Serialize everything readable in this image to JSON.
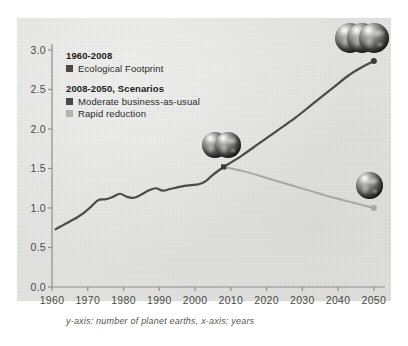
{
  "caption": "y-axis: number of planet earths, x-axis: years",
  "legend": {
    "historical_header": "1960-2008",
    "historical_label": "Ecological Footprint",
    "scenarios_header": "2008-2050, Scenarios",
    "bau_label": "Moderate business-as-usual",
    "rapid_label": "Rapid reduction",
    "dark_color": "#4a4a46",
    "light_color": "#b4b4b0"
  },
  "chart_data": {
    "type": "line",
    "title": "",
    "xlabel": "years",
    "ylabel": "number of planet earths",
    "xlim": [
      1960,
      2052
    ],
    "ylim": [
      0.0,
      3.05
    ],
    "grid": false,
    "legend_position": "top-left",
    "yticks": [
      "0.0",
      "0.5",
      "1.0",
      "1.5",
      "2.0",
      "2.5",
      "3.0"
    ],
    "ytick_values": [
      0.0,
      0.5,
      1.0,
      1.5,
      2.0,
      2.5,
      3.0
    ],
    "xticks": [
      "1960",
      "1970",
      "1980",
      "1990",
      "2000",
      "2010",
      "2020",
      "2030",
      "2040",
      "2050"
    ],
    "xtick_values": [
      1960,
      1970,
      1980,
      1990,
      2000,
      2010,
      2020,
      2030,
      2040,
      2050
    ],
    "branch_point": {
      "x": 2008,
      "y": 1.52
    },
    "series": [
      {
        "name": "Ecological Footprint",
        "period": "1960-2008",
        "color": "#4a4a46",
        "x": [
          1961,
          1963,
          1965,
          1967,
          1969,
          1971,
          1973,
          1975,
          1977,
          1979,
          1981,
          1983,
          1985,
          1987,
          1989,
          1991,
          1993,
          1995,
          1997,
          1999,
          2001,
          2003,
          2005,
          2008
        ],
        "y": [
          0.73,
          0.78,
          0.83,
          0.88,
          0.94,
          1.02,
          1.1,
          1.11,
          1.14,
          1.18,
          1.14,
          1.13,
          1.17,
          1.22,
          1.25,
          1.22,
          1.24,
          1.26,
          1.28,
          1.29,
          1.3,
          1.34,
          1.42,
          1.52
        ]
      },
      {
        "name": "Moderate business-as-usual",
        "period": "2008-2050",
        "color": "#4a4a46",
        "x": [
          2008,
          2013,
          2018,
          2023,
          2028,
          2033,
          2038,
          2043,
          2047,
          2050
        ],
        "y": [
          1.52,
          1.66,
          1.82,
          1.98,
          2.14,
          2.32,
          2.5,
          2.68,
          2.79,
          2.86
        ]
      },
      {
        "name": "Rapid reduction",
        "period": "2008-2050",
        "color": "#a8a8a4",
        "x": [
          2008,
          2014,
          2020,
          2026,
          2032,
          2038,
          2044,
          2050
        ],
        "y": [
          1.52,
          1.46,
          1.38,
          1.3,
          1.22,
          1.14,
          1.07,
          1.0
        ]
      }
    ],
    "endpoint_markers": [
      {
        "series": "Moderate business-as-usual",
        "x": 2050,
        "y": 2.86,
        "icon": "three-earths"
      },
      {
        "series": "Rapid reduction",
        "x": 2050,
        "y": 1.0,
        "icon": "one-earth"
      },
      {
        "series": "branch",
        "x": 2008,
        "y": 1.52,
        "icon": "two-earths"
      }
    ]
  }
}
